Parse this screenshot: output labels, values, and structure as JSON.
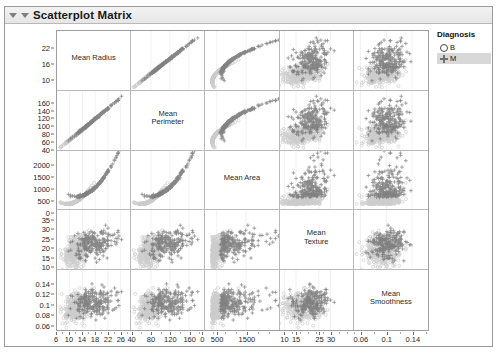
{
  "window": {
    "title": "Scatterplot Matrix",
    "disclosure_icon": "triangle-down-icon"
  },
  "legend": {
    "title": "Diagnosis",
    "entries": [
      {
        "label": "B",
        "marker": "circle-open-icon",
        "selected": false
      },
      {
        "label": "M",
        "marker": "plus-icon",
        "selected": true
      }
    ]
  },
  "chart_data": {
    "type": "scatter",
    "title": "Scatterplot Matrix",
    "variables": [
      "Mean Radius",
      "Mean Perimeter",
      "Mean Area",
      "Mean Texture",
      "Mean Smoothness"
    ],
    "diagonal_labels": [
      "Mean Radius",
      "Mean\nPerimeter",
      "Mean Area",
      "Mean\nTexture",
      "Mean\nSmoothness"
    ],
    "group_variable": "Diagnosis",
    "groups": [
      {
        "name": "B",
        "marker": "circle",
        "color": "#cccccc",
        "n": 357
      },
      {
        "name": "M",
        "marker": "plus",
        "color": "#757575",
        "n": 212
      }
    ],
    "grid": true,
    "legend_position": "right",
    "axes": [
      {
        "name": "Mean Radius",
        "ylim": [
          6.0,
          29.0
        ],
        "xlim": [
          6.0,
          29.0
        ],
        "yticks": [
          10,
          16,
          22
        ],
        "xticks": [
          6,
          10,
          14,
          18,
          22,
          26
        ]
      },
      {
        "name": "Mean Perimeter",
        "ylim": [
          38,
          192
        ],
        "xlim": [
          38,
          192
        ],
        "yticks": [
          40,
          60,
          80,
          100,
          120,
          140,
          160
        ],
        "xticks": [
          40,
          80,
          120,
          160
        ]
      },
      {
        "name": "Mean Area",
        "ylim": [
          100,
          2600
        ],
        "xlim": [
          100,
          2600
        ],
        "yticks": [
          0,
          500,
          1000,
          1500,
          2000
        ],
        "xticks": [
          0,
          500,
          1500
        ]
      },
      {
        "name": "Mean Texture",
        "ylim": [
          8,
          40
        ],
        "xlim": [
          8,
          40
        ],
        "yticks": [
          10,
          15,
          20,
          25,
          30,
          35
        ],
        "xticks": [
          10,
          15,
          25,
          30
        ]
      },
      {
        "name": "Mean Smoothness",
        "ylim": [
          0.05,
          0.165
        ],
        "xlim": [
          0.05,
          0.165
        ],
        "yticks": [
          0.06,
          0.08,
          0.1,
          0.12,
          0.14
        ],
        "xticks": [
          0.06,
          0.1,
          0.14
        ]
      }
    ],
    "group_means": {
      "B": {
        "Mean Radius": 12.15,
        "Mean Perimeter": 78.1,
        "Mean Area": 463,
        "Mean Texture": 17.9,
        "Mean Smoothness": 0.0925
      },
      "M": {
        "Mean Radius": 17.46,
        "Mean Perimeter": 115.4,
        "Mean Area": 978,
        "Mean Texture": 21.6,
        "Mean Smoothness": 0.1029
      }
    },
    "group_sds": {
      "B": {
        "Mean Radius": 1.78,
        "Mean Perimeter": 11.8,
        "Mean Area": 134,
        "Mean Texture": 4.0,
        "Mean Smoothness": 0.0134
      },
      "M": {
        "Mean Radius": 3.2,
        "Mean Perimeter": 21.9,
        "Mean Area": 368,
        "Mean Texture": 3.8,
        "Mean Smoothness": 0.0126
      }
    },
    "correlations": {
      "Mean Radius|Mean Perimeter": 0.998,
      "Mean Radius|Mean Area": 0.987,
      "Mean Radius|Mean Texture": 0.32,
      "Mean Radius|Mean Smoothness": 0.17,
      "Mean Perimeter|Mean Area": 0.987,
      "Mean Perimeter|Mean Texture": 0.33,
      "Mean Perimeter|Mean Smoothness": 0.21,
      "Mean Area|Mean Texture": 0.32,
      "Mean Area|Mean Smoothness": 0.18,
      "Mean Texture|Mean Smoothness": -0.02
    }
  }
}
